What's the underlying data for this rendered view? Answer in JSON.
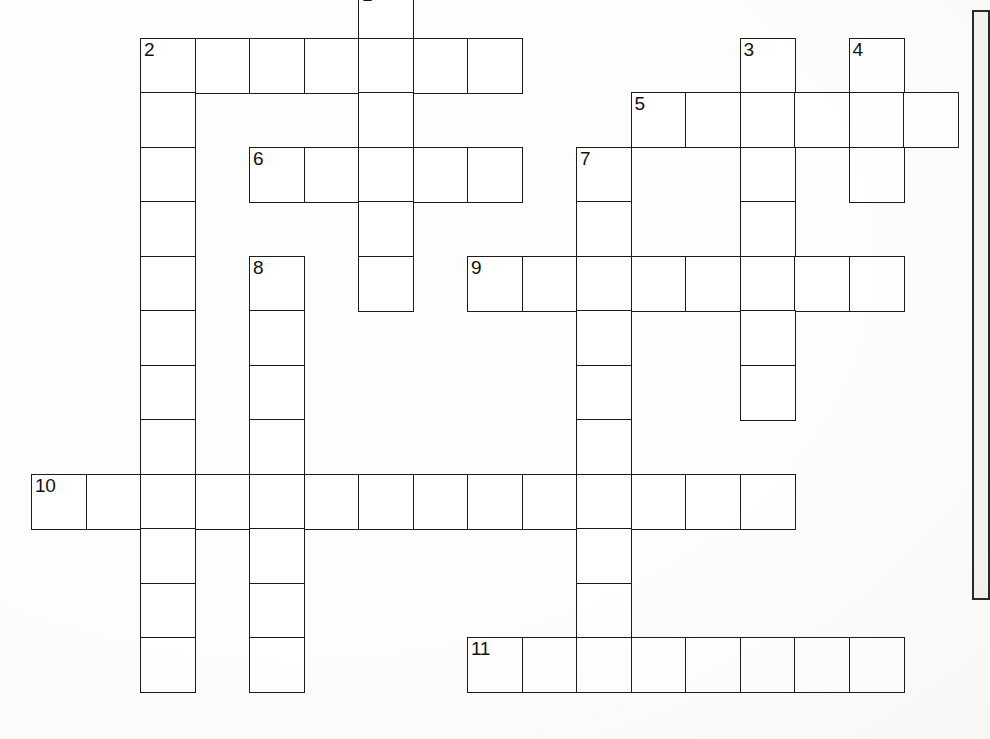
{
  "page": {
    "kind": "crossword-puzzle-grid",
    "width": 990,
    "height": 739,
    "background_color": "#fdfdfc",
    "ink_color": "#1c1c1c",
    "cell_fill_color": "#ffffff"
  },
  "grid": {
    "cell_size": 54.5,
    "origin_x": 31,
    "origin_y": -17,
    "columns": 18,
    "rows": 14,
    "note": "Cell coordinates are given as [column, row] integer grid indices."
  },
  "side_panel": {
    "label": "clue-panel-edge",
    "x": 972,
    "y": 10,
    "width": 18,
    "height": 590,
    "border_color": "#2a2a2a",
    "fill_color": "#f4f4f3"
  },
  "entries": [
    {
      "number": "1",
      "direction": "down",
      "start": [
        6,
        0
      ],
      "length": 6,
      "cells": [
        [
          6,
          0
        ],
        [
          6,
          1
        ],
        [
          6,
          2
        ],
        [
          6,
          3
        ],
        [
          6,
          4
        ],
        [
          6,
          5
        ]
      ]
    },
    {
      "number": "2",
      "direction": "across",
      "start": [
        2,
        1
      ],
      "length": 7,
      "cells": [
        [
          2,
          1
        ],
        [
          3,
          1
        ],
        [
          4,
          1
        ],
        [
          5,
          1
        ],
        [
          6,
          1
        ],
        [
          7,
          1
        ],
        [
          8,
          1
        ]
      ]
    },
    {
      "number": "2",
      "direction": "down",
      "start": [
        2,
        1
      ],
      "length": 12,
      "cells": [
        [
          2,
          1
        ],
        [
          2,
          2
        ],
        [
          2,
          3
        ],
        [
          2,
          4
        ],
        [
          2,
          5
        ],
        [
          2,
          6
        ],
        [
          2,
          7
        ],
        [
          2,
          8
        ],
        [
          2,
          9
        ],
        [
          2,
          10
        ],
        [
          2,
          11
        ],
        [
          2,
          12
        ]
      ]
    },
    {
      "number": "3",
      "direction": "down",
      "start": [
        13,
        1
      ],
      "length": 7,
      "cells": [
        [
          13,
          1
        ],
        [
          13,
          2
        ],
        [
          13,
          3
        ],
        [
          13,
          4
        ],
        [
          13,
          5
        ],
        [
          13,
          6
        ],
        [
          13,
          7
        ]
      ]
    },
    {
      "number": "4",
      "direction": "down",
      "start": [
        15,
        1
      ],
      "length": 3,
      "cells": [
        [
          15,
          1
        ],
        [
          15,
          2
        ],
        [
          15,
          3
        ]
      ]
    },
    {
      "number": "5",
      "direction": "across",
      "start": [
        11,
        2
      ],
      "length": 6,
      "cells": [
        [
          11,
          2
        ],
        [
          12,
          2
        ],
        [
          13,
          2
        ],
        [
          14,
          2
        ],
        [
          15,
          2
        ],
        [
          16,
          2
        ]
      ]
    },
    {
      "number": "6",
      "direction": "across",
      "start": [
        4,
        3
      ],
      "length": 5,
      "cells": [
        [
          4,
          3
        ],
        [
          5,
          3
        ],
        [
          6,
          3
        ],
        [
          7,
          3
        ],
        [
          8,
          3
        ]
      ]
    },
    {
      "number": "7",
      "direction": "down",
      "start": [
        10,
        3
      ],
      "length": 10,
      "cells": [
        [
          10,
          3
        ],
        [
          10,
          4
        ],
        [
          10,
          5
        ],
        [
          10,
          6
        ],
        [
          10,
          7
        ],
        [
          10,
          8
        ],
        [
          10,
          9
        ],
        [
          10,
          10
        ],
        [
          10,
          11
        ],
        [
          10,
          12
        ]
      ]
    },
    {
      "number": "8",
      "direction": "down",
      "start": [
        4,
        5
      ],
      "length": 8,
      "cells": [
        [
          4,
          5
        ],
        [
          4,
          6
        ],
        [
          4,
          7
        ],
        [
          4,
          8
        ],
        [
          4,
          9
        ],
        [
          4,
          10
        ],
        [
          4,
          11
        ],
        [
          4,
          12
        ]
      ]
    },
    {
      "number": "9",
      "direction": "across",
      "start": [
        8,
        5
      ],
      "length": 8,
      "cells": [
        [
          8,
          5
        ],
        [
          9,
          5
        ],
        [
          10,
          5
        ],
        [
          11,
          5
        ],
        [
          12,
          5
        ],
        [
          13,
          5
        ],
        [
          14,
          5
        ],
        [
          15,
          5
        ]
      ]
    },
    {
      "number": "10",
      "direction": "across",
      "start": [
        0,
        9
      ],
      "length": 14,
      "cells": [
        [
          0,
          9
        ],
        [
          1,
          9
        ],
        [
          2,
          9
        ],
        [
          3,
          9
        ],
        [
          4,
          9
        ],
        [
          5,
          9
        ],
        [
          6,
          9
        ],
        [
          7,
          9
        ],
        [
          8,
          9
        ],
        [
          9,
          9
        ],
        [
          10,
          9
        ],
        [
          11,
          9
        ],
        [
          12,
          9
        ],
        [
          13,
          9
        ]
      ]
    },
    {
      "number": "11",
      "direction": "across",
      "start": [
        8,
        12
      ],
      "length": 8,
      "cells": [
        [
          8,
          12
        ],
        [
          9,
          12
        ],
        [
          10,
          12
        ],
        [
          11,
          12
        ],
        [
          12,
          12
        ],
        [
          13,
          12
        ],
        [
          14,
          12
        ],
        [
          15,
          12
        ]
      ]
    }
  ],
  "cells": [
    {
      "col": 6,
      "row": 0,
      "number": "1",
      "letter": ""
    },
    {
      "col": 2,
      "row": 1,
      "number": "2",
      "letter": ""
    },
    {
      "col": 3,
      "row": 1,
      "number": "",
      "letter": ""
    },
    {
      "col": 4,
      "row": 1,
      "number": "",
      "letter": ""
    },
    {
      "col": 5,
      "row": 1,
      "number": "",
      "letter": ""
    },
    {
      "col": 6,
      "row": 1,
      "number": "",
      "letter": ""
    },
    {
      "col": 7,
      "row": 1,
      "number": "",
      "letter": ""
    },
    {
      "col": 8,
      "row": 1,
      "number": "",
      "letter": ""
    },
    {
      "col": 13,
      "row": 1,
      "number": "3",
      "letter": ""
    },
    {
      "col": 15,
      "row": 1,
      "number": "4",
      "letter": ""
    },
    {
      "col": 2,
      "row": 2,
      "number": "",
      "letter": ""
    },
    {
      "col": 6,
      "row": 2,
      "number": "",
      "letter": ""
    },
    {
      "col": 11,
      "row": 2,
      "number": "5",
      "letter": ""
    },
    {
      "col": 12,
      "row": 2,
      "number": "",
      "letter": ""
    },
    {
      "col": 13,
      "row": 2,
      "number": "",
      "letter": ""
    },
    {
      "col": 14,
      "row": 2,
      "number": "",
      "letter": ""
    },
    {
      "col": 15,
      "row": 2,
      "number": "",
      "letter": ""
    },
    {
      "col": 16,
      "row": 2,
      "number": "",
      "letter": ""
    },
    {
      "col": 2,
      "row": 3,
      "number": "",
      "letter": ""
    },
    {
      "col": 4,
      "row": 3,
      "number": "6",
      "letter": ""
    },
    {
      "col": 5,
      "row": 3,
      "number": "",
      "letter": ""
    },
    {
      "col": 6,
      "row": 3,
      "number": "",
      "letter": ""
    },
    {
      "col": 7,
      "row": 3,
      "number": "",
      "letter": ""
    },
    {
      "col": 8,
      "row": 3,
      "number": "",
      "letter": ""
    },
    {
      "col": 10,
      "row": 3,
      "number": "7",
      "letter": ""
    },
    {
      "col": 13,
      "row": 3,
      "number": "",
      "letter": ""
    },
    {
      "col": 15,
      "row": 3,
      "number": "",
      "letter": ""
    },
    {
      "col": 2,
      "row": 4,
      "number": "",
      "letter": ""
    },
    {
      "col": 6,
      "row": 4,
      "number": "",
      "letter": ""
    },
    {
      "col": 10,
      "row": 4,
      "number": "",
      "letter": ""
    },
    {
      "col": 13,
      "row": 4,
      "number": "",
      "letter": ""
    },
    {
      "col": 2,
      "row": 5,
      "number": "",
      "letter": ""
    },
    {
      "col": 4,
      "row": 5,
      "number": "8",
      "letter": ""
    },
    {
      "col": 6,
      "row": 5,
      "number": "",
      "letter": ""
    },
    {
      "col": 8,
      "row": 5,
      "number": "9",
      "letter": ""
    },
    {
      "col": 9,
      "row": 5,
      "number": "",
      "letter": ""
    },
    {
      "col": 10,
      "row": 5,
      "number": "",
      "letter": ""
    },
    {
      "col": 11,
      "row": 5,
      "number": "",
      "letter": ""
    },
    {
      "col": 12,
      "row": 5,
      "number": "",
      "letter": ""
    },
    {
      "col": 13,
      "row": 5,
      "number": "",
      "letter": ""
    },
    {
      "col": 14,
      "row": 5,
      "number": "",
      "letter": ""
    },
    {
      "col": 15,
      "row": 5,
      "number": "",
      "letter": ""
    },
    {
      "col": 2,
      "row": 6,
      "number": "",
      "letter": ""
    },
    {
      "col": 4,
      "row": 6,
      "number": "",
      "letter": ""
    },
    {
      "col": 10,
      "row": 6,
      "number": "",
      "letter": ""
    },
    {
      "col": 13,
      "row": 6,
      "number": "",
      "letter": ""
    },
    {
      "col": 2,
      "row": 7,
      "number": "",
      "letter": ""
    },
    {
      "col": 4,
      "row": 7,
      "number": "",
      "letter": ""
    },
    {
      "col": 10,
      "row": 7,
      "number": "",
      "letter": ""
    },
    {
      "col": 13,
      "row": 7,
      "number": "",
      "letter": ""
    },
    {
      "col": 2,
      "row": 8,
      "number": "",
      "letter": ""
    },
    {
      "col": 4,
      "row": 8,
      "number": "",
      "letter": ""
    },
    {
      "col": 10,
      "row": 8,
      "number": "",
      "letter": ""
    },
    {
      "col": 0,
      "row": 9,
      "number": "10",
      "letter": ""
    },
    {
      "col": 1,
      "row": 9,
      "number": "",
      "letter": ""
    },
    {
      "col": 2,
      "row": 9,
      "number": "",
      "letter": ""
    },
    {
      "col": 3,
      "row": 9,
      "number": "",
      "letter": ""
    },
    {
      "col": 4,
      "row": 9,
      "number": "",
      "letter": ""
    },
    {
      "col": 5,
      "row": 9,
      "number": "",
      "letter": ""
    },
    {
      "col": 6,
      "row": 9,
      "number": "",
      "letter": ""
    },
    {
      "col": 7,
      "row": 9,
      "number": "",
      "letter": ""
    },
    {
      "col": 8,
      "row": 9,
      "number": "",
      "letter": ""
    },
    {
      "col": 9,
      "row": 9,
      "number": "",
      "letter": ""
    },
    {
      "col": 10,
      "row": 9,
      "number": "",
      "letter": ""
    },
    {
      "col": 11,
      "row": 9,
      "number": "",
      "letter": ""
    },
    {
      "col": 12,
      "row": 9,
      "number": "",
      "letter": ""
    },
    {
      "col": 13,
      "row": 9,
      "number": "",
      "letter": ""
    },
    {
      "col": 2,
      "row": 10,
      "number": "",
      "letter": ""
    },
    {
      "col": 4,
      "row": 10,
      "number": "",
      "letter": ""
    },
    {
      "col": 10,
      "row": 10,
      "number": "",
      "letter": ""
    },
    {
      "col": 2,
      "row": 11,
      "number": "",
      "letter": ""
    },
    {
      "col": 4,
      "row": 11,
      "number": "",
      "letter": ""
    },
    {
      "col": 10,
      "row": 11,
      "number": "",
      "letter": ""
    },
    {
      "col": 2,
      "row": 12,
      "number": "",
      "letter": ""
    },
    {
      "col": 4,
      "row": 12,
      "number": "",
      "letter": ""
    },
    {
      "col": 8,
      "row": 12,
      "number": "11",
      "letter": ""
    },
    {
      "col": 9,
      "row": 12,
      "number": "",
      "letter": ""
    },
    {
      "col": 10,
      "row": 12,
      "number": "",
      "letter": ""
    },
    {
      "col": 11,
      "row": 12,
      "number": "",
      "letter": ""
    },
    {
      "col": 12,
      "row": 12,
      "number": "",
      "letter": ""
    },
    {
      "col": 13,
      "row": 12,
      "number": "",
      "letter": ""
    },
    {
      "col": 14,
      "row": 12,
      "number": "",
      "letter": ""
    },
    {
      "col": 15,
      "row": 12,
      "number": "",
      "letter": ""
    }
  ]
}
